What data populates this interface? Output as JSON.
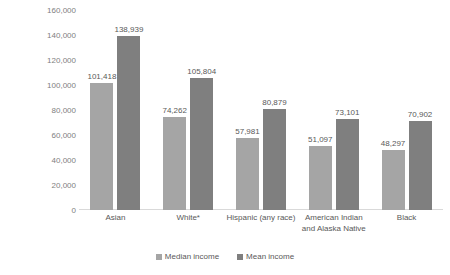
{
  "chart_data": {
    "type": "bar",
    "title": "",
    "xlabel": "",
    "ylabel": "Dollars",
    "ylim": [
      0,
      160000
    ],
    "ytick_step": 20000,
    "grid": false,
    "legend_position": "bottom",
    "categories": [
      "Asian",
      "White*",
      "Hispanic (any race)",
      "American Indian and Alaska Native",
      "Black"
    ],
    "category_lines": [
      [
        "Asian"
      ],
      [
        "White*"
      ],
      [
        "Hispanic (any race)"
      ],
      [
        "American Indian",
        "and Alaska Native"
      ],
      [
        "Black"
      ]
    ],
    "ytick_labels": [
      "160,000",
      "140,000",
      "120,000",
      "100,000",
      "80,000",
      "60,000",
      "40,000",
      "20,000",
      "0"
    ],
    "series": [
      {
        "name": "Median income",
        "color": "#a5a5a5",
        "values": [
          101418,
          74262,
          57981,
          51097,
          48297
        ],
        "labels": [
          "101,418",
          "74,262",
          "57,981",
          "51,097",
          "48,297"
        ]
      },
      {
        "name": "Mean income",
        "color": "#7f7f7f",
        "values": [
          138939,
          105804,
          80879,
          73101,
          70902
        ],
        "labels": [
          "138,939",
          "105,804",
          "80,879",
          "73,101",
          "70,902"
        ]
      }
    ]
  },
  "legend": {
    "items": [
      {
        "label": "Median income",
        "color": "#a5a5a5"
      },
      {
        "label": "Mean income",
        "color": "#7f7f7f"
      }
    ]
  }
}
